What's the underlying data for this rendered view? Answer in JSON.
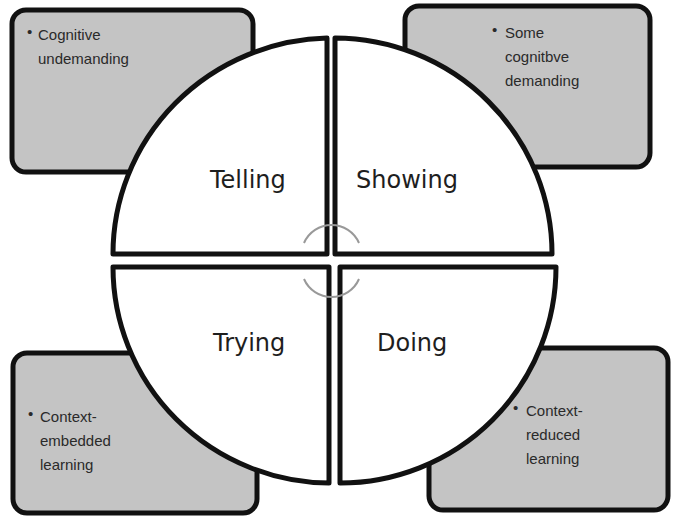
{
  "diagram": {
    "title": "",
    "colors": {
      "box_fill": "#c4c4c4",
      "outline": "#111111",
      "quadrant_fill": "#ffffff",
      "arrow": "#999999"
    },
    "quadrants": [
      {
        "id": "telling",
        "label": "Telling",
        "position": "top-left"
      },
      {
        "id": "showing",
        "label": "Showing",
        "position": "top-right"
      },
      {
        "id": "trying",
        "label": "Trying",
        "position": "bottom-left"
      },
      {
        "id": "doing",
        "label": "Doing",
        "position": "bottom-right"
      }
    ],
    "corner_boxes": [
      {
        "position": "top-left",
        "bullet": "•",
        "lines": [
          "Cognitive",
          "undemanding"
        ]
      },
      {
        "position": "top-right",
        "bullet": "•",
        "lines": [
          "Some",
          "cognitbve",
          "demanding"
        ]
      },
      {
        "position": "bottom-left",
        "bullet": "•",
        "lines": [
          "Context-",
          "embedded",
          "learning"
        ]
      },
      {
        "position": "bottom-right",
        "bullet": "•",
        "lines": [
          "Context-",
          "reduced",
          "learning"
        ]
      }
    ],
    "center_icon": "cycle-arrows-icon"
  }
}
